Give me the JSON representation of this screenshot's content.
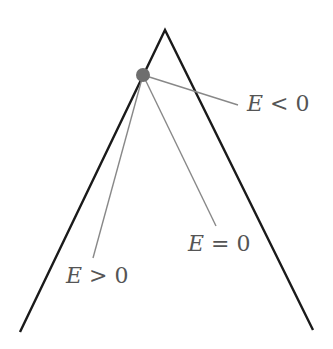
{
  "diagram": {
    "type": "potential-well-trajectories",
    "colors": {
      "background": "#ffffff",
      "boundary": "#1a1a1a",
      "trajectory": "#888888",
      "particle": "#6e6e6e",
      "label": "#555555"
    },
    "boundary": {
      "apex": [
        165,
        30
      ],
      "left_end": [
        20,
        332
      ],
      "right_end": [
        313,
        330
      ]
    },
    "particle": {
      "center": [
        143,
        75
      ],
      "radius": 7
    },
    "trajectories": [
      {
        "name": "E<0",
        "end": [
          238,
          105
        ]
      },
      {
        "name": "E=0",
        "end": [
          216,
          226
        ]
      },
      {
        "name": "E>0",
        "end": [
          93,
          258
        ]
      }
    ],
    "labels": {
      "e_less": {
        "var": "E",
        "op": " < ",
        "val": "0"
      },
      "e_equal": {
        "var": "E",
        "op": " = ",
        "val": "0"
      },
      "e_greater": {
        "var": "E",
        "op": " > ",
        "val": "0"
      }
    }
  }
}
